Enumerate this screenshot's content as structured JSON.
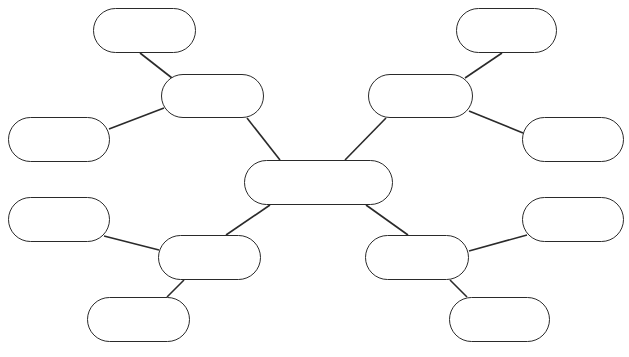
{
  "diagram": {
    "type": "mind-map",
    "stroke_color": "#2a2a2a",
    "background": "#ffffff",
    "nodes": [
      {
        "id": "center",
        "label": "",
        "x": 244,
        "y": 160,
        "w": 149,
        "h": 45
      },
      {
        "id": "upper-left-branch",
        "label": "",
        "x": 161,
        "y": 74,
        "w": 103,
        "h": 44
      },
      {
        "id": "upper-left-top-leaf",
        "label": "",
        "x": 93,
        "y": 8,
        "w": 103,
        "h": 45
      },
      {
        "id": "upper-left-side-leaf",
        "label": "",
        "x": 8,
        "y": 117,
        "w": 102,
        "h": 45
      },
      {
        "id": "upper-right-branch",
        "label": "",
        "x": 368,
        "y": 74,
        "w": 105,
        "h": 44
      },
      {
        "id": "upper-right-top-leaf",
        "label": "",
        "x": 456,
        "y": 8,
        "w": 101,
        "h": 45
      },
      {
        "id": "upper-right-side-leaf",
        "label": "",
        "x": 522,
        "y": 117,
        "w": 102,
        "h": 45
      },
      {
        "id": "lower-left-branch",
        "label": "",
        "x": 158,
        "y": 235,
        "w": 103,
        "h": 45
      },
      {
        "id": "lower-left-side-leaf",
        "label": "",
        "x": 8,
        "y": 197,
        "w": 102,
        "h": 45
      },
      {
        "id": "lower-left-bottom-leaf",
        "label": "",
        "x": 87,
        "y": 297,
        "w": 103,
        "h": 45
      },
      {
        "id": "lower-right-branch",
        "label": "",
        "x": 365,
        "y": 235,
        "w": 104,
        "h": 45
      },
      {
        "id": "lower-right-side-leaf",
        "label": "",
        "x": 522,
        "y": 197,
        "w": 102,
        "h": 45
      },
      {
        "id": "lower-right-bottom-leaf",
        "label": "",
        "x": 449,
        "y": 297,
        "w": 101,
        "h": 45
      }
    ],
    "edges": [
      {
        "from": "center",
        "to": "upper-left-branch",
        "x1": 280,
        "y1": 160,
        "x2": 247,
        "y2": 118
      },
      {
        "from": "center",
        "to": "upper-right-branch",
        "x1": 345,
        "y1": 160,
        "x2": 386,
        "y2": 118
      },
      {
        "from": "center",
        "to": "lower-left-branch",
        "x1": 270,
        "y1": 205,
        "x2": 226,
        "y2": 235
      },
      {
        "from": "center",
        "to": "lower-right-branch",
        "x1": 366,
        "y1": 205,
        "x2": 408,
        "y2": 235
      },
      {
        "from": "upper-left-branch",
        "to": "upper-left-top-leaf",
        "x1": 172,
        "y1": 78,
        "x2": 140,
        "y2": 53
      },
      {
        "from": "upper-left-branch",
        "to": "upper-left-side-leaf",
        "x1": 164,
        "y1": 108,
        "x2": 109,
        "y2": 129
      },
      {
        "from": "upper-right-branch",
        "to": "upper-right-top-leaf",
        "x1": 465,
        "y1": 78,
        "x2": 502,
        "y2": 53
      },
      {
        "from": "upper-right-branch",
        "to": "upper-right-side-leaf",
        "x1": 469,
        "y1": 111,
        "x2": 523,
        "y2": 133
      },
      {
        "from": "lower-left-branch",
        "to": "lower-left-side-leaf",
        "x1": 104,
        "y1": 236,
        "x2": 159,
        "y2": 250
      },
      {
        "from": "lower-left-branch",
        "to": "lower-left-bottom-leaf",
        "x1": 184,
        "y1": 280,
        "x2": 167,
        "y2": 297
      },
      {
        "from": "lower-right-branch",
        "to": "lower-right-side-leaf",
        "x1": 469,
        "y1": 251,
        "x2": 527,
        "y2": 235
      },
      {
        "from": "lower-right-branch",
        "to": "lower-right-bottom-leaf",
        "x1": 450,
        "y1": 280,
        "x2": 467,
        "y2": 297
      }
    ]
  }
}
